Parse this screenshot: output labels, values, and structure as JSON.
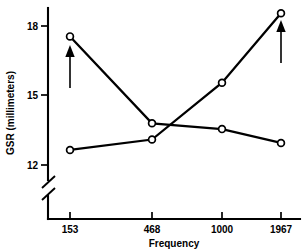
{
  "chart_data": {
    "type": "line",
    "title": "",
    "subtitle": "",
    "xlabel": "Frequency",
    "ylabel": "GSR (millimeters)",
    "categories": [
      "153",
      "468",
      "1000",
      "1967"
    ],
    "x": [
      153,
      468,
      1000,
      1967
    ],
    "xtick_labels": [
      "153",
      "468",
      "1000",
      "1967"
    ],
    "ytick_labels": [
      "12",
      "15",
      "18"
    ],
    "yticks": [
      12,
      15,
      18
    ],
    "ylim": [
      11.2,
      18.9
    ],
    "y_axis_break": true,
    "grid": false,
    "legend": "none",
    "marker": "open-circle",
    "series": [
      {
        "name": "descending",
        "values": [
          17.55,
          13.8,
          13.55,
          12.95
        ]
      },
      {
        "name": "ascending",
        "values": [
          12.65,
          13.1,
          15.55,
          18.55
        ]
      }
    ],
    "annotations": [
      {
        "name": "arrow-left",
        "at_x": 153,
        "symbol": "up-arrow"
      },
      {
        "name": "arrow-right",
        "at_x": 1967,
        "symbol": "up-arrow"
      }
    ]
  },
  "axes": {
    "x_title": "Frequency",
    "y_title": "GSR (millimeters)",
    "x_ticks": [
      {
        "label": "153"
      },
      {
        "label": "468"
      },
      {
        "label": "1000"
      },
      {
        "label": "1967"
      }
    ],
    "y_ticks": [
      {
        "label": "18"
      },
      {
        "label": "15"
      },
      {
        "label": "12"
      }
    ]
  }
}
